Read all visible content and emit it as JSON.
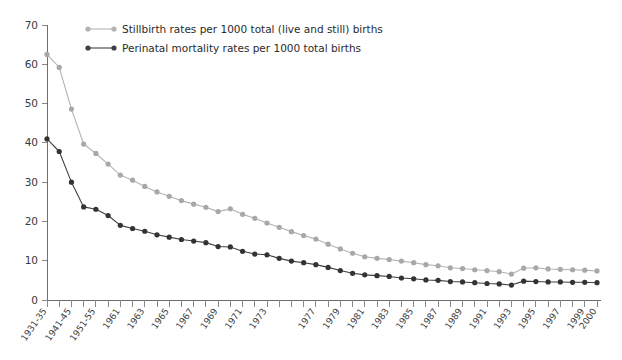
{
  "chart_data": {
    "type": "line",
    "title": "",
    "xlabel": "",
    "ylabel": "",
    "ylim": [
      0,
      70
    ],
    "ytick_step": 10,
    "grid": false,
    "legend_position": "top-left",
    "yticks": [
      "0",
      "10",
      "20",
      "30",
      "40",
      "50",
      "60",
      "70"
    ],
    "categories": [
      "1931-35",
      "1936-40",
      "1941-45",
      "1946-50",
      "1951-55",
      "1956-60",
      "1961",
      "1962",
      "1963",
      "1964",
      "1965",
      "1966",
      "1967",
      "1968",
      "1969",
      "1970",
      "1971",
      "1972",
      "1973",
      "1974",
      "1975",
      "1976",
      "1977",
      "1978",
      "1979",
      "1980",
      "1981",
      "1982",
      "1983",
      "1984",
      "1985",
      "1986",
      "1987",
      "1988",
      "1989",
      "1990",
      "1991",
      "1992",
      "1993",
      "1994",
      "1995",
      "1996",
      "1997",
      "1998",
      "1999",
      "2000"
    ],
    "xtick_labels_shown": [
      "1931-35",
      "1941-45",
      "1951-55",
      "1961",
      "1963",
      "1965",
      "1967",
      "1969",
      "1971",
      "1973",
      "1977",
      "1979",
      "1981",
      "1983",
      "1985",
      "1987",
      "1989",
      "1991",
      "1993",
      "1995",
      "1997",
      "1999",
      "2000"
    ],
    "series": [
      {
        "name": "Stillbirth rates per 1000 total (live and still) births",
        "color": "#b3b3b3",
        "marker_color": "#a8a8a8",
        "values": [
          62.5,
          59.2,
          48.6,
          39.7,
          37.3,
          34.6,
          31.8,
          30.5,
          28.9,
          27.5,
          26.4,
          25.3,
          24.4,
          23.6,
          22.5,
          23.2,
          21.8,
          20.8,
          19.6,
          18.5,
          17.4,
          16.4,
          15.5,
          14.2,
          13.0,
          11.9,
          11.0,
          10.6,
          10.3,
          9.9,
          9.5,
          9.0,
          8.7,
          8.2,
          8.0,
          7.7,
          7.5,
          7.2,
          6.6,
          8.1,
          8.2,
          7.9,
          7.8,
          7.7,
          7.6,
          7.4
        ]
      },
      {
        "name": "Perinatal mortality rates per 1000 total births",
        "color": "#404040",
        "marker_color": "#333333",
        "values": [
          41.0,
          37.8,
          30.0,
          23.7,
          23.1,
          21.5,
          19.0,
          18.2,
          17.5,
          16.6,
          16.0,
          15.4,
          15.0,
          14.6,
          13.6,
          13.5,
          12.4,
          11.7,
          11.5,
          10.6,
          9.9,
          9.5,
          9.0,
          8.3,
          7.5,
          6.8,
          6.4,
          6.2,
          6.0,
          5.6,
          5.4,
          5.1,
          5.0,
          4.7,
          4.6,
          4.4,
          4.2,
          4.1,
          3.8,
          4.8,
          4.7,
          4.6,
          4.6,
          4.5,
          4.5,
          4.4
        ]
      }
    ],
    "legend": [
      {
        "label": "Stillbirth rates per 1000 total (live and still) births",
        "color": "#b3b3b3"
      },
      {
        "label": "Perinatal mortality rates per 1000 total births",
        "color": "#404040"
      }
    ]
  }
}
